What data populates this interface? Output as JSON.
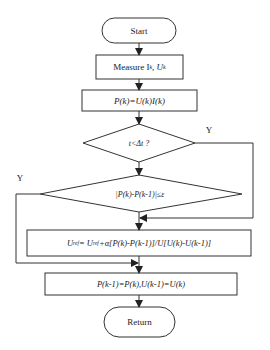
{
  "flowchart": {
    "start": {
      "label": "Start"
    },
    "measure": {
      "label": "Measure I",
      "sub1": "k",
      "sep": ", U",
      "sub2": "k"
    },
    "power": {
      "label": "P(k)=U(k)I(k)"
    },
    "decision1": {
      "label": "t<Δt ?",
      "yes_label": "Y"
    },
    "decision2": {
      "label": "|P(k)-P(k-1)|≤ε",
      "yes_label": "Y"
    },
    "update": {
      "label_pre": "U",
      "sub_a": "ref",
      "label_mid": "= U",
      "sub_b": "ref",
      "label_post": "+α[P(k)-P(k-1)]/U[U(k)-U(k-1)]"
    },
    "store": {
      "label": "P(k-1)=P(k),U(k-1)=U(k)"
    },
    "return": {
      "label": "Return"
    }
  },
  "colors": {
    "stroke": "#333333",
    "text": "#222222",
    "background": "#ffffff"
  }
}
